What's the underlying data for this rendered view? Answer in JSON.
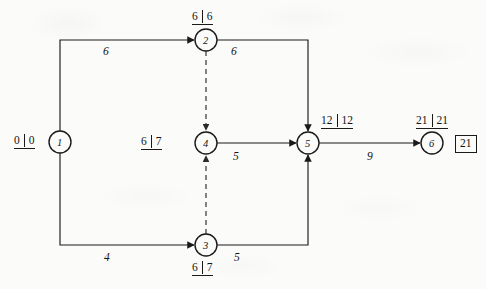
{
  "diagram": {
    "type": "activity-on-arrow-network",
    "nodes": [
      {
        "id": "1",
        "label": "1",
        "cx": 60,
        "cy": 142,
        "r": 11,
        "time": {
          "early": "0",
          "late": "0",
          "position": "left"
        }
      },
      {
        "id": "2",
        "label": "2",
        "cx": 206,
        "cy": 40,
        "r": 11,
        "time": {
          "early": "6",
          "late": "6",
          "position": "above"
        }
      },
      {
        "id": "3",
        "label": "3",
        "cx": 206,
        "cy": 245,
        "r": 11,
        "time": {
          "early": "6",
          "late": "7",
          "position": "below"
        }
      },
      {
        "id": "4",
        "label": "4",
        "cx": 206,
        "cy": 143,
        "r": 11,
        "time": {
          "early": "6",
          "late": "7",
          "position": "left"
        }
      },
      {
        "id": "5",
        "label": "5",
        "cx": 308,
        "cy": 143,
        "r": 11,
        "time": {
          "early": "12",
          "late": "12",
          "position": "above-right"
        }
      },
      {
        "id": "6",
        "label": "6",
        "cx": 432,
        "cy": 143,
        "r": 11,
        "time": {
          "early": "21",
          "late": "21",
          "position": "above"
        }
      }
    ],
    "edges": [
      {
        "from": "1",
        "to": "2",
        "weight": "6",
        "style": "solid",
        "label_x": 103,
        "label_y": 46
      },
      {
        "from": "1",
        "to": "3",
        "weight": "4",
        "style": "solid",
        "label_x": 104,
        "label_y": 252
      },
      {
        "from": "2",
        "to": "5",
        "weight": "6",
        "style": "solid",
        "label_x": 231,
        "label_y": 46
      },
      {
        "from": "2",
        "to": "4",
        "weight": "",
        "style": "dashed",
        "label_x": 0,
        "label_y": 0
      },
      {
        "from": "3",
        "to": "4",
        "weight": "",
        "style": "dashed",
        "label_x": 0,
        "label_y": 0
      },
      {
        "from": "4",
        "to": "5",
        "weight": "5",
        "style": "solid",
        "label_x": 233,
        "label_y": 151
      },
      {
        "from": "3",
        "to": "5",
        "weight": "5",
        "style": "solid",
        "label_x": 234,
        "label_y": 252
      },
      {
        "from": "5",
        "to": "6",
        "weight": "9",
        "style": "solid",
        "label_x": 367,
        "label_y": 151
      }
    ],
    "project_duration_box": {
      "value": "21",
      "x": 455,
      "y": 136
    },
    "colors": {
      "ink": "#1a1a1a",
      "paper": "#fbfbfa"
    }
  }
}
